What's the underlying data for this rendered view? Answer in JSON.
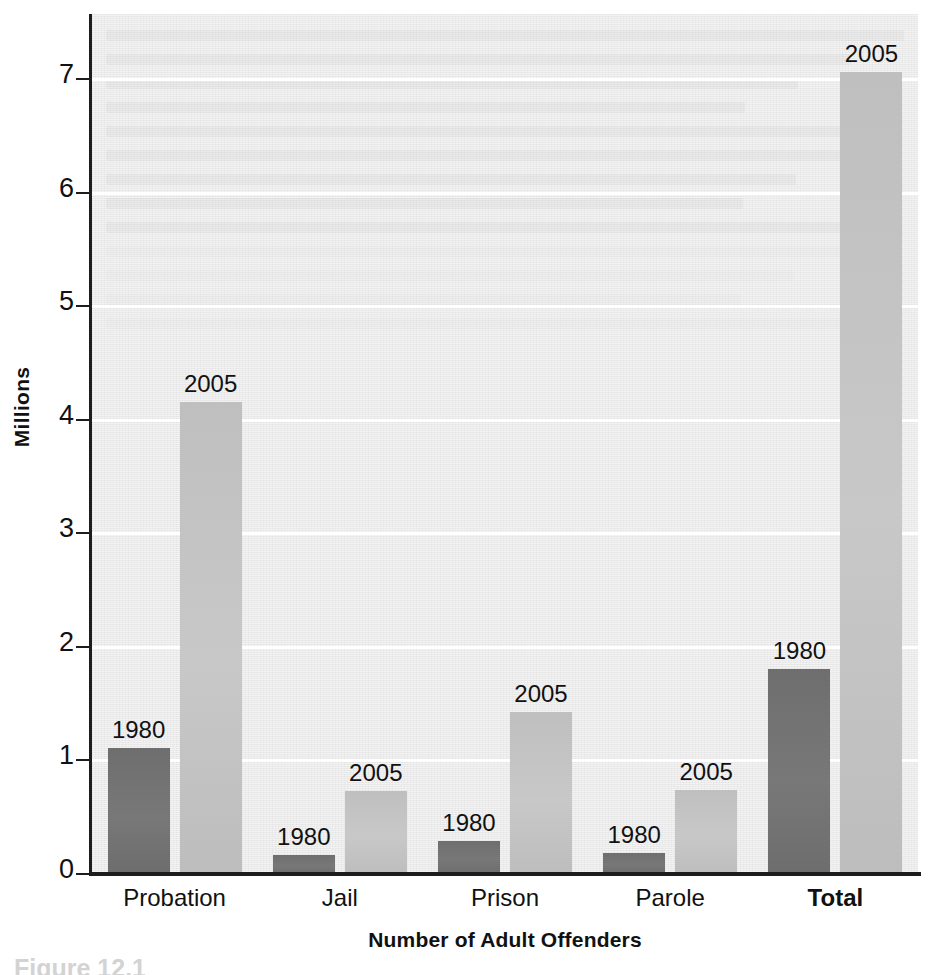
{
  "chart_data": {
    "type": "bar",
    "title": "",
    "xlabel": "Number of Adult Offenders",
    "ylabel": "Millions",
    "ylim": [
      0,
      7.5
    ],
    "y_ticks": [
      0,
      1,
      2,
      3,
      4,
      5,
      6,
      7
    ],
    "y_tick_labels": [
      "0",
      "1",
      "2",
      "3",
      "4",
      "5",
      "6",
      "7"
    ],
    "grid": "horizontal-white",
    "legend": "none-inline-labels",
    "categories": [
      "Probation",
      "Jail",
      "Prison",
      "Parole",
      "Total"
    ],
    "series": [
      {
        "name": "1980",
        "color": "#717171",
        "values": [
          1.1,
          0.16,
          0.28,
          0.18,
          1.8
        ]
      },
      {
        "name": "2005",
        "color": "#c2c2c2",
        "values": [
          4.15,
          0.72,
          1.42,
          0.73,
          7.05
        ]
      }
    ],
    "bar_labels": [
      [
        "1980",
        "2005"
      ],
      [
        "1980",
        "2005"
      ],
      [
        "1980",
        "2005"
      ],
      [
        "1980",
        "2005"
      ],
      [
        "1980",
        "2005"
      ]
    ]
  },
  "axis": {
    "y_title": "Millions",
    "x_title": "Number of Adult Offenders",
    "ticks": [
      "7",
      "6",
      "5",
      "4",
      "3",
      "2",
      "1",
      "0"
    ]
  },
  "categories": [
    {
      "label": "Probation",
      "bold": false
    },
    {
      "label": "Jail",
      "bold": false
    },
    {
      "label": "Prison",
      "bold": false
    },
    {
      "label": "Parole",
      "bold": false
    },
    {
      "label": "Total",
      "bold": true
    }
  ],
  "bars": [
    {
      "category": "Probation",
      "series": "1980",
      "value": 1.1,
      "label": "1980"
    },
    {
      "category": "Probation",
      "series": "2005",
      "value": 4.15,
      "label": "2005"
    },
    {
      "category": "Jail",
      "series": "1980",
      "value": 0.16,
      "label": "1980"
    },
    {
      "category": "Jail",
      "series": "2005",
      "value": 0.72,
      "label": "2005"
    },
    {
      "category": "Prison",
      "series": "1980",
      "value": 0.28,
      "label": "1980"
    },
    {
      "category": "Prison",
      "series": "2005",
      "value": 1.42,
      "label": "2005"
    },
    {
      "category": "Parole",
      "series": "1980",
      "value": 0.18,
      "label": "1980"
    },
    {
      "category": "Parole",
      "series": "2005",
      "value": 0.73,
      "label": "2005"
    },
    {
      "category": "Total",
      "series": "1980",
      "value": 1.8,
      "label": "1980"
    },
    {
      "category": "Total",
      "series": "2005",
      "value": 7.05,
      "label": "2005"
    }
  ],
  "caption": {
    "text": "Figure 12.1"
  },
  "colors": {
    "series_1980": "#717171",
    "series_2005": "#c2c2c2",
    "plot_background": "#e9e9e9",
    "gridline": "#ffffff",
    "axis": "#1d1d1d",
    "text": "#111111"
  }
}
